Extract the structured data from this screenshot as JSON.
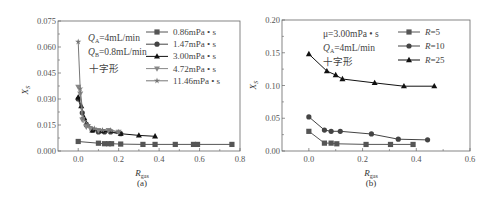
{
  "chart_data": [
    {
      "id": "a",
      "type": "line",
      "caption": "(a)",
      "title": "",
      "xlabel": "R_gas",
      "ylabel": "X_S",
      "xlim": [
        -0.1,
        0.8
      ],
      "ylim": [
        0.0,
        0.075
      ],
      "xticks": [
        "0.0",
        "0.2",
        "0.4",
        "0.6",
        "0.8"
      ],
      "yticks": [
        "0.000",
        "0.015",
        "0.030",
        "0.045",
        "0.060",
        "0.075"
      ],
      "annotations": [
        "Q_A=4mL/min",
        "Q_B=0.8mL/min",
        "十字形"
      ],
      "legend_position": "upper right",
      "series": [
        {
          "name": "0.86mPa•s",
          "marker": "square",
          "color": "#555555",
          "x": [
            0.0,
            0.1,
            0.13,
            0.15,
            0.165,
            0.21,
            0.32,
            0.38,
            0.48,
            0.57,
            0.59,
            0.76
          ],
          "y": [
            0.0055,
            0.0045,
            0.0042,
            0.0042,
            0.0042,
            0.004,
            0.0038,
            0.0038,
            0.0038,
            0.0038,
            0.0038,
            0.0038
          ]
        },
        {
          "name": "1.47mPa•s",
          "marker": "circle",
          "color": "#444444",
          "x": [
            0.0,
            0.02,
            0.04,
            0.07,
            0.1,
            0.13,
            0.16,
            0.21
          ],
          "y": [
            0.03,
            0.022,
            0.015,
            0.012,
            0.011,
            0.011,
            0.011,
            0.01
          ]
        },
        {
          "name": "3.00mPa•s",
          "marker": "triangle-up",
          "color": "#111111",
          "x": [
            0.0,
            0.015,
            0.03,
            0.07,
            0.12,
            0.21,
            0.3,
            0.38
          ],
          "y": [
            0.031,
            0.026,
            0.019,
            0.012,
            0.0115,
            0.01,
            0.009,
            0.0085
          ]
        },
        {
          "name": "4.72mPa•s",
          "marker": "triangle-down",
          "color": "#888888",
          "x": [
            0.0,
            0.01,
            0.02,
            0.04,
            0.06,
            0.1,
            0.15,
            0.2
          ],
          "y": [
            0.037,
            0.033,
            0.018,
            0.014,
            0.013,
            0.012,
            0.012,
            0.011
          ]
        },
        {
          "name": "11.46mPa•s",
          "marker": "star",
          "color": "#777777",
          "x": [
            0.0,
            0.01,
            0.025,
            0.05,
            0.08,
            0.12,
            0.16,
            0.2
          ],
          "y": [
            0.063,
            0.036,
            0.019,
            0.015,
            0.013,
            0.012,
            0.012,
            0.011
          ]
        }
      ]
    },
    {
      "id": "b",
      "type": "line",
      "caption": "(b)",
      "title": "",
      "xlabel": "R_gas",
      "ylabel": "X_S",
      "xlim": [
        -0.1,
        0.6
      ],
      "ylim": [
        0.0,
        0.2
      ],
      "xticks": [
        "0.0",
        "0.2",
        "0.4",
        "0.6"
      ],
      "yticks": [
        "0.00",
        "0.05",
        "0.10",
        "0.15",
        "0.20"
      ],
      "annotations": [
        "μ=3.00mPa•s",
        "Q_A=4mL/min",
        "十字形"
      ],
      "legend_position": "upper right",
      "series": [
        {
          "name": "R=5",
          "marker": "square",
          "color": "#555555",
          "x": [
            0.0,
            0.058,
            0.083,
            0.104,
            0.213,
            0.304,
            0.388
          ],
          "y": [
            0.03,
            0.012,
            0.012,
            0.011,
            0.01,
            0.01,
            0.01
          ]
        },
        {
          "name": "R=10",
          "marker": "circle",
          "color": "#444444",
          "x": [
            0.0,
            0.058,
            0.083,
            0.117,
            0.233,
            0.333,
            0.442
          ],
          "y": [
            0.052,
            0.032,
            0.03,
            0.03,
            0.026,
            0.018,
            0.017
          ]
        },
        {
          "name": "R=25",
          "marker": "triangle-up",
          "color": "#111111",
          "x": [
            0.0,
            0.067,
            0.1,
            0.125,
            0.245,
            0.354,
            0.467
          ],
          "y": [
            0.148,
            0.122,
            0.116,
            0.11,
            0.104,
            0.099,
            0.099
          ]
        }
      ]
    }
  ],
  "labels": {
    "a": {
      "ylabel_main": "X",
      "ylabel_sub": "S",
      "xlabel_main": "R",
      "xlabel_sub": "gas",
      "caption": "(a)",
      "ann1_main": "Q",
      "ann1_sub": "A",
      "ann1_rest": "=4mL/min",
      "ann2_main": "Q",
      "ann2_sub": "B",
      "ann2_rest": "=0.8mL/min",
      "ann3": "十字形"
    },
    "b": {
      "ylabel_main": "X",
      "ylabel_sub": "S",
      "xlabel_main": "R",
      "xlabel_sub": "gas",
      "caption": "(b)",
      "ann1": "μ=3.00mPa • s",
      "ann2_main": "Q",
      "ann2_sub": "A",
      "ann2_rest": "=4mL/min",
      "ann3": "十字形"
    }
  }
}
